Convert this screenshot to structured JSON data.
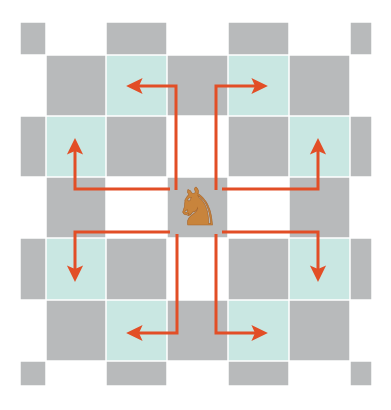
{
  "diagram": {
    "piece": {
      "name": "knight",
      "glyph": "♞",
      "color": "#c8843c",
      "square": {
        "row": 3,
        "col": 3
      }
    },
    "colors": {
      "dark_square": "#b8babb",
      "light_square": "#c9e7e2",
      "empty_square": "#ffffff",
      "arrow": "#e24e26",
      "grid_line": "#ffffff"
    },
    "grid": {
      "col_edges": [
        20,
        46,
        106,
        167,
        228,
        289,
        350,
        372
      ],
      "row_edges": [
        22,
        55,
        116,
        177,
        238,
        300,
        361,
        386
      ],
      "cells": [
        [
          "dark",
          "empty",
          "dark",
          "empty",
          "dark",
          "empty",
          "dark"
        ],
        [
          "empty",
          "dark",
          "light",
          "dark",
          "light",
          "dark",
          "empty"
        ],
        [
          "dark",
          "light",
          "dark",
          "white",
          "dark",
          "light",
          "dark"
        ],
        [
          "empty",
          "dark",
          "white",
          "piece",
          "white",
          "dark",
          "empty"
        ],
        [
          "dark",
          "light",
          "dark",
          "white",
          "dark",
          "light",
          "dark"
        ],
        [
          "empty",
          "dark",
          "light",
          "dark",
          "light",
          "dark",
          "empty"
        ],
        [
          "dark",
          "empty",
          "dark",
          "empty",
          "dark",
          "empty",
          "dark"
        ]
      ]
    },
    "moves": [
      {
        "name": "up-left",
        "points": [
          [
            176,
            190
          ],
          [
            176,
            86
          ],
          [
            130,
            86
          ]
        ]
      },
      {
        "name": "up-right",
        "points": [
          [
            216,
            190
          ],
          [
            216,
            86
          ],
          [
            264,
            86
          ]
        ]
      },
      {
        "name": "left-up",
        "points": [
          [
            170,
            189
          ],
          [
            75,
            189
          ],
          [
            75,
            142
          ]
        ]
      },
      {
        "name": "right-up",
        "points": [
          [
            222,
            189
          ],
          [
            318,
            189
          ],
          [
            318,
            142
          ]
        ]
      },
      {
        "name": "left-down",
        "points": [
          [
            170,
            232
          ],
          [
            75,
            232
          ],
          [
            75,
            278
          ]
        ]
      },
      {
        "name": "right-down",
        "points": [
          [
            222,
            232
          ],
          [
            318,
            232
          ],
          [
            318,
            278
          ]
        ]
      },
      {
        "name": "down-left",
        "points": [
          [
            177,
            234
          ],
          [
            177,
            333
          ],
          [
            130,
            333
          ]
        ]
      },
      {
        "name": "down-right",
        "points": [
          [
            216,
            234
          ],
          [
            216,
            333
          ],
          [
            264,
            333
          ]
        ]
      }
    ]
  }
}
